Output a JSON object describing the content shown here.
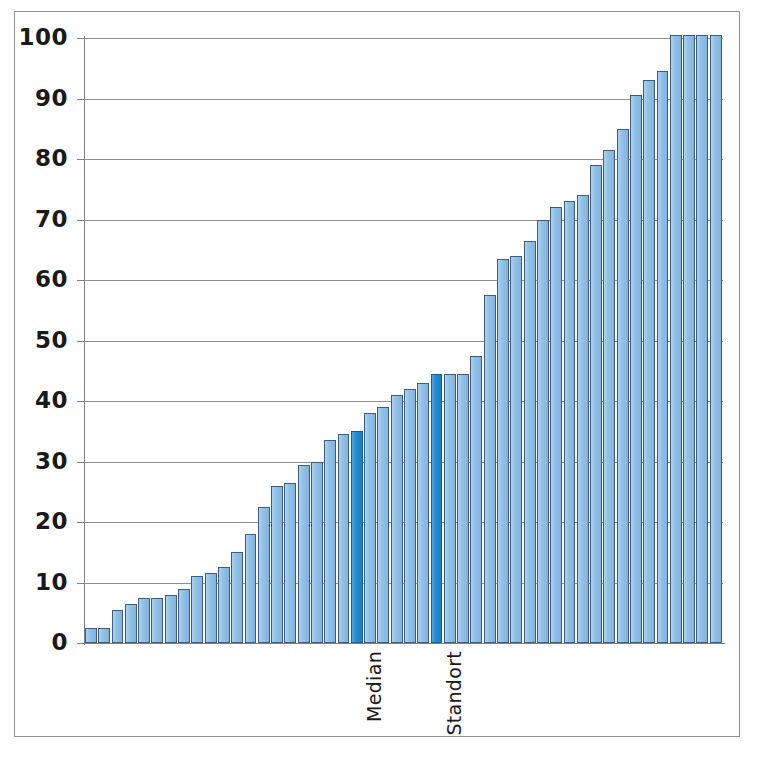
{
  "chart_data": {
    "type": "bar",
    "title": "",
    "subtitle": "",
    "xlabel": "",
    "ylabel": "",
    "ylim": [
      0,
      100
    ],
    "yticks": [
      0,
      10,
      20,
      30,
      40,
      50,
      60,
      70,
      80,
      90,
      100
    ],
    "ytick_labels": [
      "0",
      "10",
      "20",
      "30",
      "40",
      "50",
      "60",
      "70",
      "80",
      "90",
      "100"
    ],
    "grid": "horizontal",
    "legend": "none",
    "sorted": "ascending",
    "bar_count": 48,
    "categories": [
      "1",
      "2",
      "3",
      "4",
      "5",
      "6",
      "7",
      "8",
      "9",
      "10",
      "11",
      "12",
      "13",
      "14",
      "15",
      "16",
      "17",
      "18",
      "19",
      "20",
      "21",
      "22",
      "23",
      "24",
      "25",
      "26",
      "27",
      "28",
      "29",
      "30",
      "31",
      "32",
      "33",
      "34",
      "35",
      "36",
      "37",
      "38",
      "39",
      "40",
      "41",
      "42",
      "43",
      "44",
      "45",
      "46",
      "47",
      "48"
    ],
    "values": [
      2.5,
      2.5,
      5.5,
      6.5,
      7.5,
      7.5,
      8.0,
      9.0,
      11.0,
      11.5,
      12.5,
      15.0,
      18.0,
      22.5,
      26.0,
      26.5,
      29.5,
      30.0,
      33.5,
      34.5,
      35.0,
      38.0,
      39.0,
      41.0,
      42.0,
      43.0,
      44.5,
      44.5,
      44.5,
      47.5,
      57.5,
      63.5,
      64.0,
      66.5,
      70.0,
      72.0,
      73.0,
      74.0,
      79.0,
      81.5,
      85.0,
      90.5,
      93.0,
      94.5,
      100.5,
      100.5,
      100.5,
      100.5
    ],
    "bar_colors": {
      "default": "#8dbfe8",
      "default_border": "#3c5d80",
      "highlight": "#1e8bd4",
      "highlight_border": "#14618f"
    },
    "highlighted": [
      {
        "index": 20,
        "label": "Median",
        "value": 35.0
      },
      {
        "index": 26,
        "label": "Standort",
        "value": 44.5
      }
    ],
    "annotations": [
      {
        "name": "median-label",
        "text": "Median",
        "rotation": -90
      },
      {
        "name": "standort-label",
        "text": "Standort",
        "rotation": -90
      }
    ],
    "axis_line_color": "#7d8184",
    "gridline_color": "#8b8f93",
    "frame_color": "#8e9296",
    "background": "#ffffff"
  }
}
